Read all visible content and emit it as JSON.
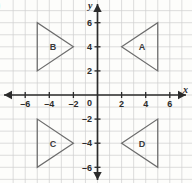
{
  "problem": {
    "label": ")"
  },
  "chart_data": {
    "type": "scatter",
    "title": "",
    "xlabel": "x",
    "ylabel": "y",
    "xlim": [
      -6.8,
      6.8
    ],
    "ylim": [
      -6.8,
      6.8
    ],
    "grid": true,
    "grid_step": 1,
    "legend": "none",
    "x_ticks": [
      -6,
      -4,
      -2,
      0,
      2,
      4,
      6
    ],
    "x_tick_labels": [
      "–6",
      "–4",
      "–2",
      "0",
      "2",
      "4",
      "6"
    ],
    "y_ticks": [
      6,
      4,
      2,
      -2,
      -4,
      -6
    ],
    "y_tick_labels": [
      "6",
      "4",
      "2",
      "–2",
      "–4",
      "–6"
    ],
    "origin_label": "0",
    "axis_arrows": [
      "left",
      "right",
      "up",
      "down"
    ],
    "shapes": [
      {
        "name": "A",
        "kind": "triangle",
        "quadrant": 1,
        "orientation": "points-left",
        "label_x": 3.7,
        "label_y": 4.0,
        "vertices": [
          [
            5,
            6
          ],
          [
            5,
            2
          ],
          [
            2,
            4
          ]
        ]
      },
      {
        "name": "B",
        "kind": "triangle",
        "quadrant": 2,
        "orientation": "points-right",
        "label_x": -3.7,
        "label_y": 4.0,
        "vertices": [
          [
            -5,
            6
          ],
          [
            -5,
            2
          ],
          [
            -2,
            4
          ]
        ]
      },
      {
        "name": "C",
        "kind": "triangle",
        "quadrant": 3,
        "orientation": "points-right",
        "label_x": -3.7,
        "label_y": -4.0,
        "vertices": [
          [
            -5,
            -2
          ],
          [
            -5,
            -6
          ],
          [
            -2,
            -4
          ]
        ]
      },
      {
        "name": "D",
        "kind": "triangle",
        "quadrant": 4,
        "orientation": "points-left",
        "label_x": 3.7,
        "label_y": -4.0,
        "vertices": [
          [
            5,
            -2
          ],
          [
            5,
            -6
          ],
          [
            2,
            -4
          ]
        ]
      }
    ]
  },
  "colors": {
    "background": "#fdfdfb",
    "grid": "#cfcfcf",
    "axis": "#2b2b2b",
    "shape_stroke": "#6d6d6d",
    "text": "#2b2b2b"
  }
}
